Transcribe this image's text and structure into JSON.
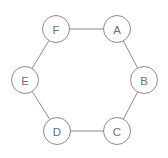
{
  "figure": {
    "type": "undirected-graph",
    "title": "",
    "background_color": "#ffffff",
    "width": 168,
    "height": 158
  },
  "style": {
    "node_fill": "#ffffff",
    "node_stroke": "#8a8a8a",
    "node_stroke_width": 1,
    "node_radius": 13.5,
    "edge_stroke": "#8a8a8a",
    "edge_stroke_width": 1,
    "label_color": "#6f6f6f",
    "label_font_size": 11.5
  },
  "chart_data": {
    "type": "diagram",
    "layout": "hexagonal-ring",
    "title": "",
    "nodes": [
      {
        "id": "A",
        "label": "A",
        "x": 117,
        "y": 29
      },
      {
        "id": "B",
        "label": "B",
        "x": 144,
        "y": 80
      },
      {
        "id": "C",
        "label": "C",
        "x": 117,
        "y": 131
      },
      {
        "id": "D",
        "label": "D",
        "x": 57,
        "y": 131
      },
      {
        "id": "E",
        "label": "E",
        "x": 25,
        "y": 80
      },
      {
        "id": "F",
        "label": "F",
        "x": 56,
        "y": 29
      }
    ],
    "edges": [
      {
        "from": "F",
        "to": "A"
      },
      {
        "from": "A",
        "to": "B"
      },
      {
        "from": "B",
        "to": "C"
      },
      {
        "from": "C",
        "to": "D"
      },
      {
        "from": "D",
        "to": "E"
      },
      {
        "from": "E",
        "to": "F"
      }
    ],
    "node_count": 6,
    "edge_count": 6
  }
}
